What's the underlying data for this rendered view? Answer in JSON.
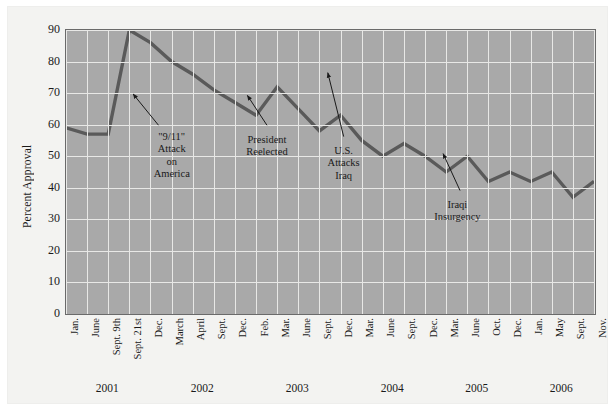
{
  "figure": {
    "background_color": "#f3f3f1",
    "plot_background_color": "#a9a9a9",
    "grid_color": "#e8e8e6",
    "line_color": "#5a5a5a",
    "border_color": "#6a6a6a"
  },
  "chart_data": {
    "type": "line",
    "title": "",
    "xlabel": "",
    "ylabel": "Percent Approval",
    "ylim": [
      0,
      90
    ],
    "yticks": [
      0,
      10,
      20,
      30,
      40,
      50,
      60,
      70,
      80,
      90
    ],
    "grid": true,
    "legend": "none",
    "categories": [
      "Jan.",
      "June",
      "Sept. 9th",
      "Sept. 21st",
      "Dec.",
      "March",
      "April",
      "Sept.",
      "Dec.",
      "Feb.",
      "Mar.",
      "June",
      "Sept.",
      "Dec.",
      "Mar.",
      "June",
      "Sept.",
      "Dec.",
      "Mar.",
      "June",
      "Oct.",
      "Dec.",
      "Jan.",
      "May",
      "Sept.",
      "Nov."
    ],
    "values": [
      59,
      57,
      57,
      90,
      86,
      80,
      76,
      71,
      67,
      63,
      72,
      65,
      58,
      63,
      55,
      50,
      54,
      50,
      45,
      50,
      42,
      45,
      42,
      45,
      37,
      42
    ],
    "year_groups": [
      {
        "label": "2001",
        "start_index": 0,
        "end_index": 4
      },
      {
        "label": "2002",
        "start_index": 5,
        "end_index": 8
      },
      {
        "label": "2003",
        "start_index": 9,
        "end_index": 13
      },
      {
        "label": "2004",
        "start_index": 14,
        "end_index": 17
      },
      {
        "label": "2005",
        "start_index": 18,
        "end_index": 21
      },
      {
        "label": "2006",
        "start_index": 22,
        "end_index": 25
      }
    ],
    "annotations": [
      {
        "name": "nine-eleven",
        "text": "\"9/11\"\nAttack\non\nAmerica",
        "point_index": 3,
        "label_x_pct": 21.5,
        "label_y_pct": 38,
        "arrow_from_x_pct": 19.0,
        "arrow_from_y_pct": 36.0,
        "arrow_to_x_pct": 14.2,
        "arrow_to_y_pct": 25.0
      },
      {
        "name": "president-reelected",
        "text": "President\nReelected",
        "point_index": 8,
        "label_x_pct": 39.5,
        "label_y_pct": 39,
        "arrow_from_x_pct": 39.5,
        "arrow_from_y_pct": 36.0,
        "arrow_to_x_pct": 35.8,
        "arrow_to_y_pct": 25.5
      },
      {
        "name": "us-attacks-iraq",
        "text": "U.S.\nAttacks\nIraq",
        "point_index": 10,
        "label_x_pct": 54.0,
        "label_y_pct": 43,
        "arrow_from_x_pct": 54.0,
        "arrow_from_y_pct": 40.0,
        "arrow_to_x_pct": 51.0,
        "arrow_to_y_pct": 17.5
      },
      {
        "name": "iraqi-insurgency",
        "text": "Iraqi\nInsurgency",
        "point_index": 19,
        "label_x_pct": 75.5,
        "label_y_pct": 62,
        "arrow_from_x_pct": 76.0,
        "arrow_from_y_pct": 59.0,
        "arrow_to_x_pct": 72.8,
        "arrow_to_y_pct": 46.0
      }
    ]
  }
}
